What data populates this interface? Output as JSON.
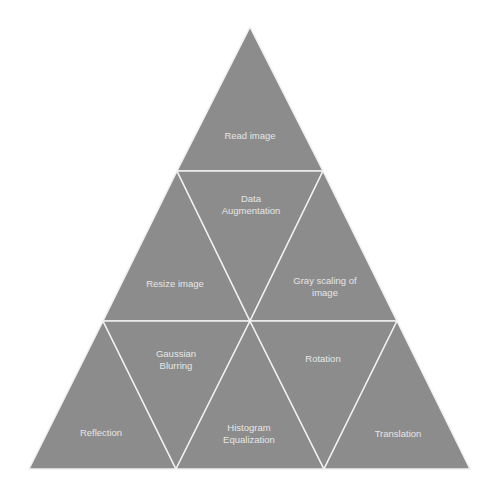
{
  "diagram": {
    "type": "triangle-pyramid",
    "colors": {
      "fill": "#8c8c8c",
      "stroke": "#f0f0f0",
      "text": "#e6e6e6",
      "background": "#ffffff"
    },
    "rows": [
      {
        "cells": [
          {
            "label": "Read image",
            "orientation": "up"
          }
        ]
      },
      {
        "cells": [
          {
            "label": "Resize image",
            "orientation": "up"
          },
          {
            "label": "Data Augmentation",
            "orientation": "down"
          },
          {
            "label": "Gray scaling of image",
            "orientation": "up"
          }
        ]
      },
      {
        "cells": [
          {
            "label": "Reflection",
            "orientation": "up"
          },
          {
            "label": "Gaussian Blurring",
            "orientation": "down"
          },
          {
            "label": "Histogram Equalization",
            "orientation": "up"
          },
          {
            "label": "Rotation",
            "orientation": "down"
          },
          {
            "label": "Translation",
            "orientation": "up"
          }
        ]
      }
    ],
    "labels": {
      "read": "Read image",
      "data1": "Data",
      "data2": "Augmentation",
      "resize": "Resize image",
      "gray1": "Gray scaling of",
      "gray2": "image",
      "gauss1": "Gaussian",
      "gauss2": "Blurring",
      "reflection": "Reflection",
      "hist1": "Histogram",
      "hist2": "Equalization",
      "rotation": "Rotation",
      "translation": "Translation"
    }
  }
}
